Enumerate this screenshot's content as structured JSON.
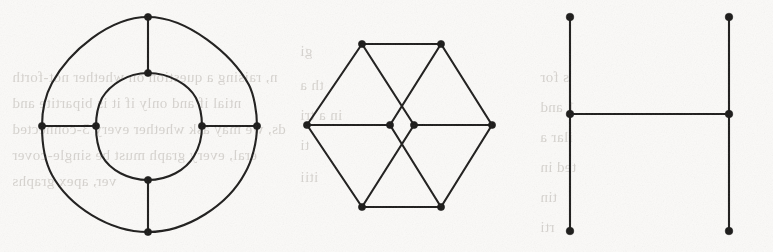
{
  "page": {
    "width": 773,
    "height": 252,
    "background_color": "#fbfaf8",
    "ink_color": "#1c1b1a",
    "bleed_text_color": "#b9b4ae"
  },
  "figures": [
    {
      "id": "figure-left",
      "name": "concentric-cycle-graph",
      "label": "",
      "vertex_count": 8,
      "edge_count": 12,
      "vertices": [
        {
          "name": "outer-top",
          "x": 148,
          "y": 17
        },
        {
          "name": "outer-right",
          "x": 257,
          "y": 126
        },
        {
          "name": "outer-bottom",
          "x": 148,
          "y": 232
        },
        {
          "name": "outer-left",
          "x": 42,
          "y": 126
        },
        {
          "name": "inner-top",
          "x": 148,
          "y": 73
        },
        {
          "name": "inner-right",
          "x": 202,
          "y": 126
        },
        {
          "name": "inner-bottom",
          "x": 148,
          "y": 180
        },
        {
          "name": "inner-left",
          "x": 96,
          "y": 126
        }
      ],
      "spoke_edges": [
        [
          "outer-top",
          "inner-top"
        ],
        [
          "outer-right",
          "inner-right"
        ],
        [
          "outer-bottom",
          "inner-bottom"
        ],
        [
          "outer-left",
          "inner-left"
        ]
      ]
    },
    {
      "id": "figure-middle",
      "name": "hexagon-with-central-digon",
      "label": "",
      "vertex_count": 8,
      "edge_count": 12,
      "vertices": [
        {
          "name": "hex-top-left",
          "x": 362,
          "y": 44
        },
        {
          "name": "hex-top-right",
          "x": 441,
          "y": 44
        },
        {
          "name": "hex-right",
          "x": 492,
          "y": 125
        },
        {
          "name": "hex-bottom-right",
          "x": 441,
          "y": 207
        },
        {
          "name": "hex-bottom-left",
          "x": 362,
          "y": 207
        },
        {
          "name": "hex-left",
          "x": 307,
          "y": 125
        },
        {
          "name": "center-left",
          "x": 390,
          "y": 125
        },
        {
          "name": "center-right",
          "x": 414,
          "y": 125
        }
      ],
      "edges": [
        [
          "hex-top-left",
          "hex-top-right"
        ],
        [
          "hex-top-right",
          "hex-right"
        ],
        [
          "hex-right",
          "hex-bottom-right"
        ],
        [
          "hex-bottom-right",
          "hex-bottom-left"
        ],
        [
          "hex-bottom-left",
          "hex-left"
        ],
        [
          "hex-left",
          "hex-top-left"
        ],
        [
          "hex-left",
          "center-left"
        ],
        [
          "hex-right",
          "center-right"
        ],
        [
          "hex-top-left",
          "center-right"
        ],
        [
          "hex-bottom-left",
          "center-right"
        ],
        [
          "hex-top-right",
          "center-left"
        ],
        [
          "hex-bottom-right",
          "center-left"
        ]
      ]
    },
    {
      "id": "figure-right",
      "name": "h-shaped-tree",
      "label": "",
      "vertex_count": 6,
      "edge_count": 5,
      "vertices": [
        {
          "name": "left-top",
          "x": 570,
          "y": 17
        },
        {
          "name": "left-middle",
          "x": 570,
          "y": 114
        },
        {
          "name": "left-bottom",
          "x": 570,
          "y": 231
        },
        {
          "name": "right-top",
          "x": 729,
          "y": 17
        },
        {
          "name": "right-middle",
          "x": 729,
          "y": 114
        },
        {
          "name": "right-bottom",
          "x": 729,
          "y": 231
        }
      ],
      "edges": [
        [
          "left-top",
          "left-middle"
        ],
        [
          "left-middle",
          "left-bottom"
        ],
        [
          "right-top",
          "right-middle"
        ],
        [
          "right-middle",
          "right-bottom"
        ],
        [
          "left-middle",
          "right-middle"
        ]
      ]
    }
  ],
  "bleed_through_text": [
    {
      "x": 12,
      "y": 62,
      "text": "n, raising a question on whether not-forth"
    },
    {
      "x": 12,
      "y": 88,
      "text": "ntial if and only if it is bipartite and"
    },
    {
      "x": 12,
      "y": 114,
      "text": "ds, we may ask whether every 3-connected"
    },
    {
      "x": 12,
      "y": 140,
      "text": "eral, every graph must be single-cover"
    },
    {
      "x": 12,
      "y": 166,
      "text": "ver, apex graphs"
    },
    {
      "x": 300,
      "y": 36,
      "text": "gi"
    },
    {
      "x": 300,
      "y": 70,
      "text": "th a"
    },
    {
      "x": 300,
      "y": 100,
      "text": "in a tri"
    },
    {
      "x": 300,
      "y": 130,
      "text": "ti"
    },
    {
      "x": 300,
      "y": 162,
      "text": "itii"
    },
    {
      "x": 540,
      "y": 62,
      "text": "s for"
    },
    {
      "x": 540,
      "y": 92,
      "text": "1 and"
    },
    {
      "x": 540,
      "y": 122,
      "text": "ilar a"
    },
    {
      "x": 540,
      "y": 152,
      "text": "ted in"
    },
    {
      "x": 540,
      "y": 182,
      "text": "tin"
    },
    {
      "x": 540,
      "y": 212,
      "text": "rti"
    }
  ]
}
